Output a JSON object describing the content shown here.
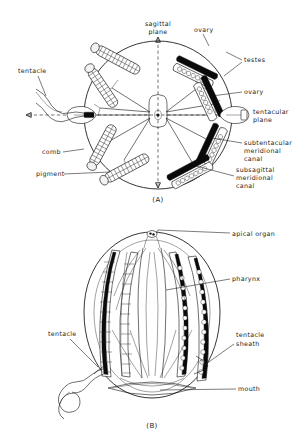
{
  "figure": {
    "ink_color": "#111111",
    "background_color": "#ffffff"
  },
  "panels": [
    {
      "id": "A",
      "caption": "(A)",
      "view": "oral / aboral view showing radial symmetry",
      "labels": [
        {
          "key": "sagittal_plane",
          "text_line1": "sagittal",
          "text_line2": "plane",
          "position": "top-center"
        },
        {
          "key": "ovary_top",
          "text_line1": "ovary",
          "text_line2": "",
          "position": "top-right"
        },
        {
          "key": "testes",
          "text_line1": "testes",
          "text_line2": "",
          "position": "right-upper"
        },
        {
          "key": "ovary_right",
          "text_line1": "ovary",
          "text_line2": "",
          "position": "right"
        },
        {
          "key": "tentacular_plane",
          "text_line1": "tentacular",
          "text_line2": "plane",
          "position": "right-middle"
        },
        {
          "key": "subtentacular_meridional_canal",
          "text_line1": "subtentacular",
          "text_line2": "meridional",
          "text_line3": "canal",
          "position": "right-lower"
        },
        {
          "key": "subsagittal_meridional_canal",
          "text_line1": "subsagittal",
          "text_line2": "meridional",
          "text_line3": "canal",
          "position": "right-bottom"
        },
        {
          "key": "tentacle",
          "text_line1": "tentacle",
          "text_line2": "",
          "position": "left-upper"
        },
        {
          "key": "comb",
          "text_line1": "comb",
          "text_line2": "",
          "position": "left-lower"
        },
        {
          "key": "pigment",
          "text_line1": "pigment",
          "text_line2": "",
          "position": "left-bottom"
        }
      ]
    },
    {
      "id": "B",
      "caption": "(B)",
      "view": "lateral whole-animal view",
      "labels": [
        {
          "key": "apical_organ",
          "text_line1": "apical organ",
          "text_line2": "",
          "position": "top-right"
        },
        {
          "key": "pharynx",
          "text_line1": "pharynx",
          "text_line2": "",
          "position": "right-upper"
        },
        {
          "key": "tentacle_sheath",
          "text_line1": "tentacle",
          "text_line2": "sheath",
          "position": "right-lower"
        },
        {
          "key": "tentacle",
          "text_line1": "tentacle",
          "text_line2": "",
          "position": "left"
        },
        {
          "key": "mouth",
          "text_line1": "mouth",
          "text_line2": "",
          "position": "bottom-right"
        }
      ]
    }
  ]
}
